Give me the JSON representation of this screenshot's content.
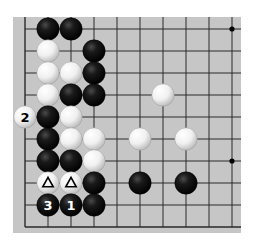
{
  "diagram": {
    "type": "go-board-fragment",
    "board": {
      "background": "#c6c6c6",
      "line_color": "#2a2a2a",
      "rect": {
        "x": 13,
        "y": 17,
        "w": 228,
        "h": 216
      },
      "columns": 10,
      "rows": 10,
      "origin": {
        "x": 25,
        "y": 29
      },
      "spacing": {
        "x": 23,
        "y": 22
      },
      "edges": {
        "left": true,
        "bottom": true,
        "top": false,
        "right": false
      },
      "star_points": [
        {
          "col": 9,
          "row": 0
        },
        {
          "col": 9,
          "row": 6
        }
      ]
    },
    "stones": [
      {
        "color": "black",
        "col": 1,
        "row": 0
      },
      {
        "color": "black",
        "col": 2,
        "row": 0
      },
      {
        "color": "white",
        "col": 1,
        "row": 1
      },
      {
        "color": "black",
        "col": 3,
        "row": 1
      },
      {
        "color": "white",
        "col": 1,
        "row": 2
      },
      {
        "color": "white",
        "col": 2,
        "row": 2
      },
      {
        "color": "black",
        "col": 3,
        "row": 2
      },
      {
        "color": "white",
        "col": 1,
        "row": 3
      },
      {
        "color": "black",
        "col": 2,
        "row": 3
      },
      {
        "color": "black",
        "col": 3,
        "row": 3
      },
      {
        "color": "white",
        "col": 6,
        "row": 3
      },
      {
        "color": "white",
        "col": 0,
        "row": 4,
        "label": "2"
      },
      {
        "color": "black",
        "col": 1,
        "row": 4
      },
      {
        "color": "white",
        "col": 2,
        "row": 4
      },
      {
        "color": "black",
        "col": 1,
        "row": 5
      },
      {
        "color": "white",
        "col": 2,
        "row": 5
      },
      {
        "color": "white",
        "col": 3,
        "row": 5
      },
      {
        "color": "white",
        "col": 5,
        "row": 5
      },
      {
        "color": "white",
        "col": 7,
        "row": 5
      },
      {
        "color": "black",
        "col": 1,
        "row": 6
      },
      {
        "color": "black",
        "col": 2,
        "row": 6
      },
      {
        "color": "white",
        "col": 3,
        "row": 6
      },
      {
        "color": "white",
        "col": 1,
        "row": 7,
        "marker": "triangle"
      },
      {
        "color": "white",
        "col": 2,
        "row": 7,
        "marker": "triangle"
      },
      {
        "color": "black",
        "col": 3,
        "row": 7
      },
      {
        "color": "black",
        "col": 5,
        "row": 7
      },
      {
        "color": "black",
        "col": 7,
        "row": 7
      },
      {
        "color": "black",
        "col": 1,
        "row": 8,
        "label": "3"
      },
      {
        "color": "black",
        "col": 2,
        "row": 8,
        "label": "1"
      },
      {
        "color": "black",
        "col": 3,
        "row": 8
      }
    ],
    "move_labels": [
      "1",
      "2",
      "3"
    ],
    "markers": [
      "triangle",
      "triangle"
    ]
  }
}
